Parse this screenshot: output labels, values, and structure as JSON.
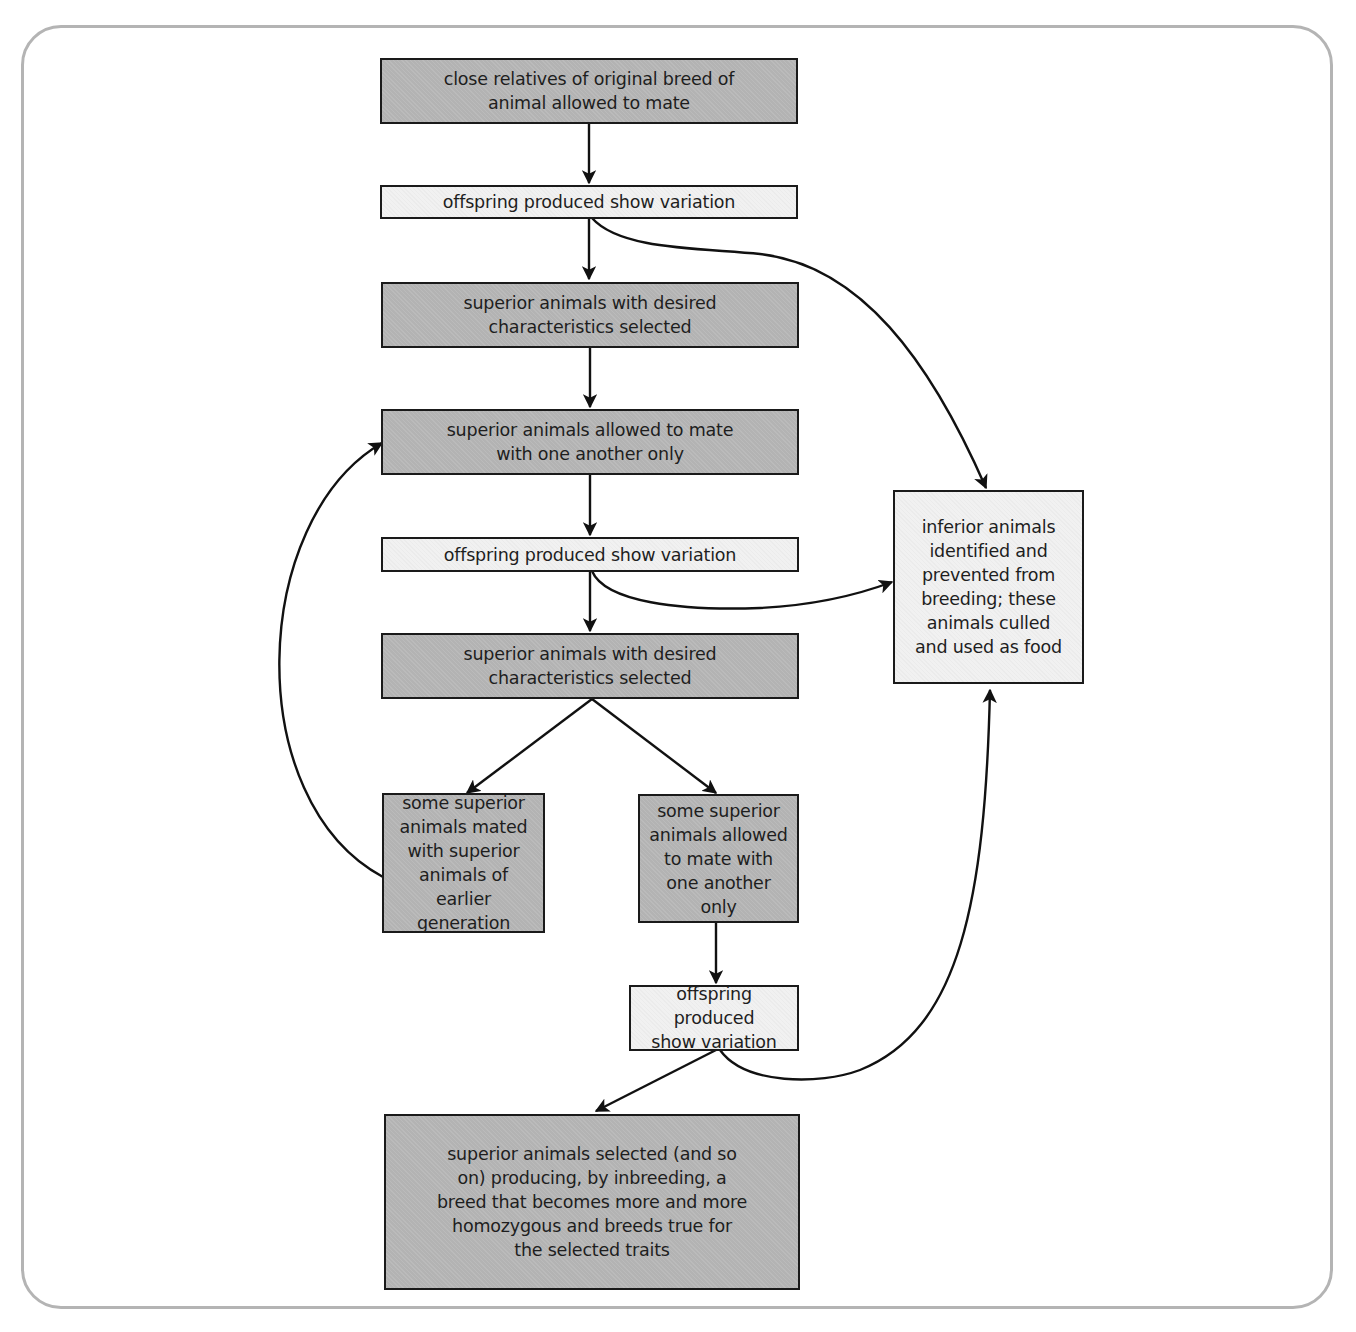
{
  "diagram": {
    "type": "flowchart",
    "colors": {
      "process_box": "#b3b3b3",
      "variation_box": "#f1f1f1",
      "outline": "#1a1a1a",
      "frame": "#b4b4b4"
    },
    "nodes": [
      {
        "id": "n1",
        "style": "dark",
        "label": "close relatives of original breed of\nanimal allowed to mate"
      },
      {
        "id": "n2",
        "style": "light",
        "label": "offspring produced show variation"
      },
      {
        "id": "n3",
        "style": "dark",
        "label": "superior animals with desired\ncharacteristics selected"
      },
      {
        "id": "n4",
        "style": "dark",
        "label": "superior animals allowed to mate\nwith one another only"
      },
      {
        "id": "n5",
        "style": "light",
        "label": "offspring produced show variation"
      },
      {
        "id": "n6",
        "style": "dark",
        "label": "superior animals with desired\ncharacteristics selected"
      },
      {
        "id": "n7",
        "style": "dark",
        "label": "some superior\nanimals mated\nwith superior\nanimals of\nearlier generation"
      },
      {
        "id": "n8",
        "style": "dark",
        "label": "some superior\nanimals allowed\nto mate with\none another\nonly"
      },
      {
        "id": "n9",
        "style": "light",
        "label": "offspring produced\nshow variation"
      },
      {
        "id": "n10",
        "style": "dark",
        "label": "superior animals selected (and so\non) producing, by inbreeding, a\nbreed that becomes more and more\nhomozygous and breeds true for\nthe selected traits"
      },
      {
        "id": "n11",
        "style": "light",
        "label": "inferior animals\nidentified and\nprevented from\nbreeding; these\nanimals culled\nand used as food"
      }
    ],
    "edges": [
      {
        "from": "n1",
        "to": "n2"
      },
      {
        "from": "n2",
        "to": "n3"
      },
      {
        "from": "n2",
        "to": "n11"
      },
      {
        "from": "n3",
        "to": "n4"
      },
      {
        "from": "n4",
        "to": "n5"
      },
      {
        "from": "n5",
        "to": "n6"
      },
      {
        "from": "n5",
        "to": "n11"
      },
      {
        "from": "n6",
        "to": "n7"
      },
      {
        "from": "n6",
        "to": "n8"
      },
      {
        "from": "n7",
        "to": "n4"
      },
      {
        "from": "n8",
        "to": "n9"
      },
      {
        "from": "n9",
        "to": "n10"
      },
      {
        "from": "n9",
        "to": "n11"
      }
    ]
  }
}
